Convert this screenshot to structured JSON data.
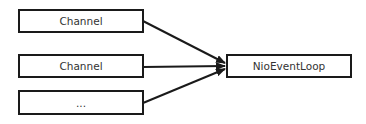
{
  "diagram": {
    "type": "flow",
    "nodes": [
      {
        "id": "channel1",
        "label": "Channel"
      },
      {
        "id": "channel2",
        "label": "Channel"
      },
      {
        "id": "more",
        "label": "..."
      },
      {
        "id": "loop",
        "label": "NioEventLoop"
      }
    ],
    "edges": [
      {
        "from": "channel1",
        "to": "loop"
      },
      {
        "from": "channel2",
        "to": "loop"
      },
      {
        "from": "more",
        "to": "loop"
      }
    ],
    "colors": {
      "stroke": "#1a1a1a",
      "text": "#333333",
      "background": "#ffffff"
    }
  }
}
